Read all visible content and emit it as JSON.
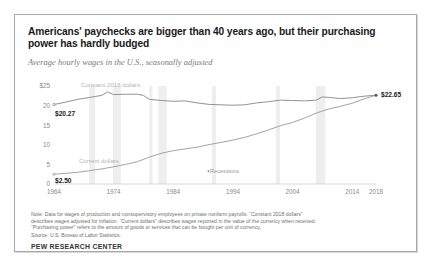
{
  "chart_title": "Americans' paychecks are bigger than 40 years ago, but their purchasing power has hardly budged",
  "chart_subtitle": "Average hourly wages in the U.S., seasonally adjusted",
  "notes": {
    "line1": "Note: Data for wages of production and nonsupervisory employees on private nonfarm payrolls. “Constant 2018 dollars”",
    "line2": "describes wages adjusted for inflation. “Current dollars” describes wages reported in the value of the currency when received.",
    "line3": "“Purchasing power” refers to the amount of goods or services that can be bought per unit of currency.",
    "source": "Source: U.S. Bureau of Labor Statistics."
  },
  "brand": "PEW RESEARCH CENTER",
  "chart_data": {
    "type": "line",
    "title": "Americans' paychecks are bigger than 40 years ago, but their purchasing power has hardly budged",
    "subtitle": "Average hourly wages in the U.S., seasonally adjusted",
    "xlabel": "",
    "ylabel": "",
    "xlim": [
      1964,
      2018
    ],
    "ylim": [
      0,
      25
    ],
    "grid": false,
    "legend_position": "inline",
    "y_ticks": [
      "$25",
      "20",
      "15",
      "10",
      "5",
      "0"
    ],
    "y_tick_values": [
      25,
      20,
      15,
      10,
      5,
      0
    ],
    "x_ticks": [
      "1964",
      "1974",
      "1984",
      "1994",
      "2004",
      "2014",
      "2018"
    ],
    "x_tick_values": [
      1964,
      1974,
      1984,
      1994,
      2004,
      2014,
      2018
    ],
    "annotations": [
      {
        "text": "Constant 2018 dollars",
        "x": 1966.5,
        "y": 24.3
      },
      {
        "text": "Current dollars",
        "x": 1966.5,
        "y": 5.3
      },
      {
        "text": "Recessions",
        "x": 1989.5,
        "y": 3.1
      },
      {
        "text": "$20.27",
        "x": 1964,
        "y": 20.27
      },
      {
        "text": "$2.50",
        "x": 1964,
        "y": 2.5
      },
      {
        "text": "$22.65",
        "x": 2018,
        "y": 22.65
      }
    ],
    "series": [
      {
        "name": "Constant 2018 dollars",
        "color": "#8c8c8c",
        "start_value": 20.27,
        "end_value": 22.65,
        "x": [
          1964,
          1966,
          1968,
          1970,
          1972,
          1973,
          1974,
          1976,
          1978,
          1979,
          1980,
          1982,
          1984,
          1986,
          1988,
          1990,
          1992,
          1994,
          1996,
          1998,
          2000,
          2002,
          2004,
          2006,
          2008,
          2009,
          2010,
          2012,
          2014,
          2016,
          2018
        ],
        "values": [
          20.27,
          20.9,
          21.6,
          22.1,
          22.6,
          23.5,
          22.8,
          22.9,
          22.9,
          22.6,
          21.6,
          21.3,
          21.1,
          21.2,
          20.7,
          20.3,
          20.2,
          20.1,
          20.2,
          20.7,
          21.0,
          21.4,
          21.3,
          21.2,
          21.4,
          22.2,
          22.1,
          21.8,
          22.0,
          22.4,
          22.65
        ]
      },
      {
        "name": "Current dollars",
        "color": "#9e9e9e",
        "start_value": 2.5,
        "end_value": 22.65,
        "x": [
          1964,
          1966,
          1968,
          1970,
          1972,
          1974,
          1976,
          1978,
          1980,
          1982,
          1984,
          1986,
          1988,
          1990,
          1992,
          1994,
          1996,
          1998,
          2000,
          2002,
          2004,
          2006,
          2008,
          2010,
          2012,
          2014,
          2016,
          2018
        ],
        "values": [
          2.5,
          2.72,
          3.0,
          3.4,
          3.85,
          4.4,
          5.0,
          5.7,
          6.85,
          7.85,
          8.5,
          8.95,
          9.4,
          10.05,
          10.6,
          11.2,
          11.9,
          12.8,
          13.8,
          14.9,
          15.7,
          16.8,
          18.1,
          19.1,
          19.8,
          20.6,
          21.7,
          22.65
        ]
      }
    ],
    "recession_bands": [
      [
        1969.9,
        1970.9
      ],
      [
        1973.9,
        1975.2
      ],
      [
        1980.0,
        1980.5
      ],
      [
        1981.5,
        1982.9
      ],
      [
        1990.5,
        1991.2
      ],
      [
        2001.2,
        2001.9
      ],
      [
        2007.9,
        2009.5
      ]
    ]
  }
}
